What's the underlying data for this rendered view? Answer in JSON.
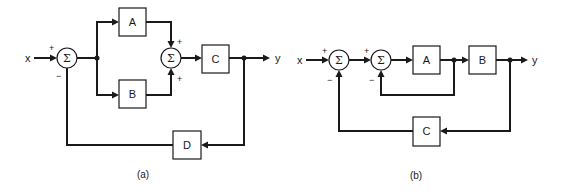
{
  "diagram_a": {
    "caption": "(a)",
    "input_label": "x",
    "output_label": "y",
    "sum1": {
      "symbol": "Σ",
      "sign_in": "+",
      "sign_fb": "−"
    },
    "sum2": {
      "symbol": "Σ",
      "sign_top": "+",
      "sign_bottom": "+"
    },
    "blocks": {
      "A": "A",
      "B": "B",
      "C": "C",
      "D": "D"
    }
  },
  "diagram_b": {
    "caption": "(b)",
    "input_label": "x",
    "output_label": "y",
    "sum1": {
      "symbol": "Σ",
      "sign_in": "+",
      "sign_fb": "−"
    },
    "sum2": {
      "symbol": "Σ",
      "sign_in": "+",
      "sign_fb": "−"
    },
    "blocks": {
      "A": "A",
      "B": "B",
      "C": "C"
    }
  },
  "colors": {
    "stroke": "#1a1a1a",
    "background": "#ffffff"
  }
}
